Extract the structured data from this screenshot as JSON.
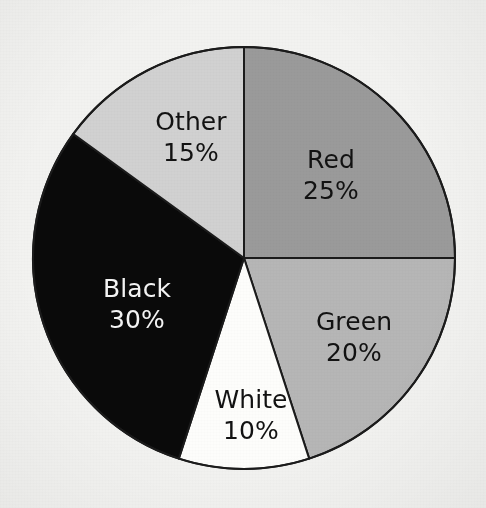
{
  "chart_data": {
    "type": "pie",
    "title": "",
    "subtitle": "",
    "xlabel": "",
    "ylabel": "",
    "grid": false,
    "legend_position": "none",
    "label_format": "name + percent",
    "start_angle_deg": 0,
    "direction": "clockwise",
    "units": "%",
    "total": 100,
    "categories": [
      "Red",
      "Green",
      "White",
      "Black",
      "Other"
    ],
    "values": [
      25,
      20,
      10,
      30,
      15
    ],
    "slices": [
      {
        "name": "Red",
        "value": 25,
        "percent_label": "25%",
        "fill": "#9a9a9a",
        "text_color": "#121212",
        "start_deg": 0,
        "end_deg": 90,
        "label_x": 331,
        "label_y": 168
      },
      {
        "name": "Green",
        "value": 20,
        "percent_label": "20%",
        "fill": "#b6b6b6",
        "text_color": "#121212",
        "start_deg": 90,
        "end_deg": 162,
        "label_x": 354,
        "label_y": 330
      },
      {
        "name": "White",
        "value": 10,
        "percent_label": "10%",
        "fill": "#fdfdfb",
        "text_color": "#121212",
        "start_deg": 162,
        "end_deg": 198,
        "label_x": 251,
        "label_y": 408
      },
      {
        "name": "Black",
        "value": 30,
        "percent_label": "30%",
        "fill": "#0a0a0a",
        "text_color": "#f4f4f4",
        "start_deg": 198,
        "end_deg": 306,
        "label_x": 137,
        "label_y": 297
      },
      {
        "name": "Other",
        "value": 15,
        "percent_label": "15%",
        "fill": "#d1d1d1",
        "text_color": "#121212",
        "start_deg": 306,
        "end_deg": 360,
        "label_x": 191,
        "label_y": 130
      }
    ],
    "geometry": {
      "center_x": 244,
      "center_y": 258,
      "radius": 211,
      "stroke": "#1b1b1b",
      "stroke_width": 2
    },
    "background_color": "#f2f2f0"
  }
}
